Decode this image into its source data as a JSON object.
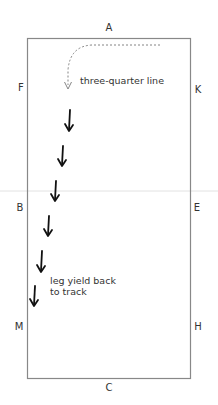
{
  "arena": {
    "markers": {
      "top": "A",
      "bottom": "C",
      "left_upper": "F",
      "left_middle": "B",
      "left_lower": "M",
      "right_upper": "K",
      "right_middle": "E",
      "right_lower": "H"
    },
    "border_color": "#888888"
  },
  "annotations": {
    "three_quarter_line": "three-quarter line",
    "leg_yield_line1": "leg yield back",
    "leg_yield_line2": "to track"
  },
  "path": {
    "dashed_turn_color": "#777777",
    "arrow_color": "#111111",
    "arrow_count": 6
  }
}
